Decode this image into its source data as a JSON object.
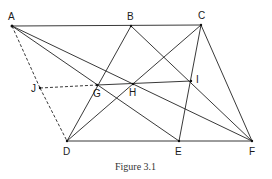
{
  "figure": {
    "caption": "Figure 3.1",
    "points": {
      "A": {
        "label": "A",
        "x": 12,
        "y": 26
      },
      "B": {
        "label": "B",
        "x": 131,
        "y": 26
      },
      "C": {
        "label": "C",
        "x": 201,
        "y": 25
      },
      "D": {
        "label": "D",
        "x": 67,
        "y": 141
      },
      "E": {
        "label": "E",
        "x": 179,
        "y": 141
      },
      "F": {
        "label": "F",
        "x": 252,
        "y": 141
      },
      "G": {
        "label": "G",
        "x": 97,
        "y": 85
      },
      "H": {
        "label": "H",
        "x": 133,
        "y": 84
      },
      "I": {
        "label": "I",
        "x": 191,
        "y": 81
      },
      "J": {
        "label": "J",
        "x": 40,
        "y": 88
      }
    },
    "solid_segments": [
      "AC",
      "DF",
      "CF",
      "AE",
      "AF",
      "BD",
      "BF",
      "CD",
      "CE",
      "GI"
    ],
    "dashed_segments": [
      "AJ",
      "JD",
      "JG"
    ],
    "colors": {
      "line": "#222222",
      "background": "#ffffff"
    }
  }
}
